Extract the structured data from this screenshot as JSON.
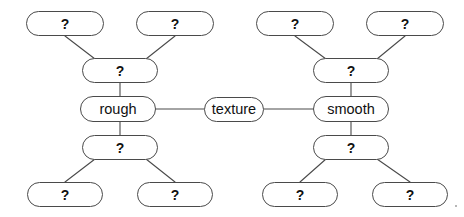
{
  "diagram": {
    "canvas": {
      "width": 464,
      "height": 217,
      "background": "#ffffff"
    },
    "style": {
      "node_border_color": "#4a4a4a",
      "node_fill": "#ffffff",
      "edge_color": "#4a4a4a",
      "text_color": "#111111"
    },
    "nodes": [
      {
        "id": "center",
        "label": "texture",
        "kind": "word",
        "x": 204,
        "y": 97,
        "w": 60,
        "h": 25
      },
      {
        "id": "l_mid_up",
        "label": "rough",
        "kind": "word",
        "x": 80,
        "y": 96,
        "w": 76,
        "h": 26
      },
      {
        "id": "l_up2",
        "label": "?",
        "kind": "q",
        "x": 82,
        "y": 58,
        "w": 76,
        "h": 25
      },
      {
        "id": "l_up_left",
        "label": "?",
        "kind": "q",
        "x": 26,
        "y": 11,
        "w": 78,
        "h": 25
      },
      {
        "id": "l_up_right",
        "label": "?",
        "kind": "q",
        "x": 136,
        "y": 11,
        "w": 78,
        "h": 25
      },
      {
        "id": "l_dn2",
        "label": "?",
        "kind": "q",
        "x": 82,
        "y": 135,
        "w": 76,
        "h": 25
      },
      {
        "id": "l_dn_left",
        "label": "?",
        "kind": "q",
        "x": 27,
        "y": 182,
        "w": 76,
        "h": 25
      },
      {
        "id": "l_dn_right",
        "label": "?",
        "kind": "q",
        "x": 137,
        "y": 182,
        "w": 76,
        "h": 25
      },
      {
        "id": "r_mid_up",
        "label": "smooth",
        "kind": "word",
        "x": 313,
        "y": 96,
        "w": 76,
        "h": 26
      },
      {
        "id": "r_up2",
        "label": "?",
        "kind": "q",
        "x": 313,
        "y": 58,
        "w": 76,
        "h": 25
      },
      {
        "id": "r_up_left",
        "label": "?",
        "kind": "q",
        "x": 256,
        "y": 11,
        "w": 78,
        "h": 25
      },
      {
        "id": "r_up_right",
        "label": "?",
        "kind": "q",
        "x": 366,
        "y": 11,
        "w": 78,
        "h": 25
      },
      {
        "id": "r_dn2",
        "label": "?",
        "kind": "q",
        "x": 313,
        "y": 135,
        "w": 76,
        "h": 25
      },
      {
        "id": "r_dn_left",
        "label": "?",
        "kind": "q",
        "x": 262,
        "y": 182,
        "w": 76,
        "h": 25
      },
      {
        "id": "r_dn_right",
        "label": "?",
        "kind": "q",
        "x": 372,
        "y": 182,
        "w": 76,
        "h": 25
      }
    ],
    "edges": [
      {
        "from": "l_mid_up",
        "to": "center",
        "x1": 156,
        "y1": 109,
        "x2": 204,
        "y2": 109
      },
      {
        "from": "center",
        "to": "r_mid_up",
        "x1": 264,
        "y1": 109,
        "x2": 313,
        "y2": 109
      },
      {
        "from": "l_up2",
        "to": "l_mid_up",
        "x1": 120,
        "y1": 83,
        "x2": 120,
        "y2": 96
      },
      {
        "from": "l_up_left",
        "to": "l_up2",
        "x1": 65,
        "y1": 36,
        "x2": 95,
        "y2": 59
      },
      {
        "from": "l_up_right",
        "to": "l_up2",
        "x1": 175,
        "y1": 36,
        "x2": 146,
        "y2": 59
      },
      {
        "from": "l_mid_up",
        "to": "l_dn2",
        "x1": 120,
        "y1": 122,
        "x2": 120,
        "y2": 135
      },
      {
        "from": "l_dn2",
        "to": "l_dn_left",
        "x1": 95,
        "y1": 159,
        "x2": 65,
        "y2": 182
      },
      {
        "from": "l_dn2",
        "to": "l_dn_right",
        "x1": 146,
        "y1": 159,
        "x2": 175,
        "y2": 182
      },
      {
        "from": "r_up2",
        "to": "r_mid_up",
        "x1": 351,
        "y1": 83,
        "x2": 351,
        "y2": 96
      },
      {
        "from": "r_up_left",
        "to": "r_up2",
        "x1": 295,
        "y1": 36,
        "x2": 326,
        "y2": 59
      },
      {
        "from": "r_up_right",
        "to": "r_up2",
        "x1": 405,
        "y1": 36,
        "x2": 377,
        "y2": 59
      },
      {
        "from": "r_mid_up",
        "to": "r_dn2",
        "x1": 351,
        "y1": 122,
        "x2": 351,
        "y2": 135
      },
      {
        "from": "r_dn2",
        "to": "r_dn_left",
        "x1": 326,
        "y1": 159,
        "x2": 300,
        "y2": 182
      },
      {
        "from": "r_dn2",
        "to": "r_dn_right",
        "x1": 377,
        "y1": 159,
        "x2": 410,
        "y2": 182
      }
    ],
    "specks": [
      {
        "x": 455,
        "y": 205
      }
    ]
  }
}
